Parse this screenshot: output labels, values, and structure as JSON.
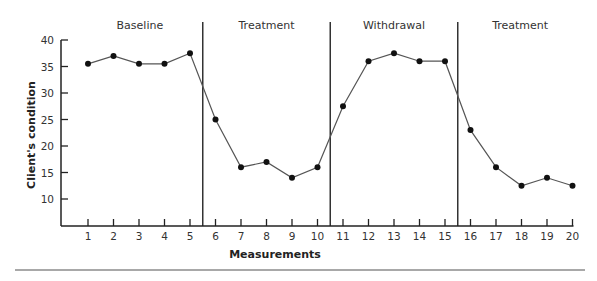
{
  "chart_data": {
    "type": "line",
    "title": "",
    "xlabel": "Measurements",
    "ylabel": "Client's condition",
    "x": [
      1,
      2,
      3,
      4,
      5,
      6,
      7,
      8,
      9,
      10,
      11,
      12,
      13,
      14,
      15,
      16,
      17,
      18,
      19,
      20
    ],
    "series": [
      {
        "name": "Client's condition",
        "values": [
          35.5,
          37,
          35.5,
          35.5,
          37.5,
          25,
          16,
          17,
          14,
          16,
          27.5,
          36,
          37.5,
          36,
          36,
          23,
          16,
          12.5,
          14,
          12.5
        ]
      }
    ],
    "yticks": [
      10,
      15,
      20,
      25,
      30,
      35,
      40
    ],
    "xticks": [
      1,
      2,
      3,
      4,
      5,
      6,
      7,
      8,
      9,
      10,
      11,
      12,
      13,
      14,
      15,
      16,
      17,
      18,
      19,
      20
    ],
    "ylim": [
      5,
      40
    ],
    "xlim": [
      0,
      20.5
    ],
    "grid": false,
    "legend": "none",
    "phases": [
      {
        "label": "Baseline",
        "start": 1,
        "end": 5
      },
      {
        "label": "Treatment",
        "start": 6,
        "end": 10
      },
      {
        "label": "Withdrawal",
        "start": 11,
        "end": 15
      },
      {
        "label": "Treatment",
        "start": 16,
        "end": 20
      }
    ],
    "phase_dividers": [
      5.5,
      10.5,
      15.5
    ]
  },
  "colors": {
    "line": "#555555",
    "marker": "#111111",
    "axis": "#222222",
    "divider": "#333333",
    "rule": "#a8a8a8"
  }
}
